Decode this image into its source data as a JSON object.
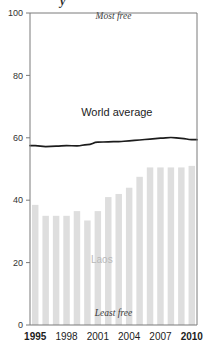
{
  "chart_data": {
    "type": "bar",
    "title": "",
    "xlabel": "",
    "ylabel": "",
    "ylim": [
      0,
      100
    ],
    "yticks": [
      0,
      20,
      40,
      60,
      80,
      100
    ],
    "xticks": [
      "1995",
      "1998",
      "2001",
      "2004",
      "2007",
      "2010"
    ],
    "xtick_bold": [
      "1995",
      "2010"
    ],
    "grid": false,
    "legend": "none",
    "categories": [
      "1995",
      "1996",
      "1997",
      "1998",
      "1999",
      "2000",
      "2001",
      "2002",
      "2003",
      "2004",
      "2005",
      "2006",
      "2007",
      "2008",
      "2009",
      "2010"
    ],
    "series": [
      {
        "name": "Laos",
        "kind": "bar",
        "color": "#dedede",
        "values": [
          38.5,
          35.0,
          35.0,
          35.0,
          36.5,
          33.5,
          36.5,
          41.0,
          42.0,
          44.0,
          47.5,
          50.5,
          50.5,
          50.5,
          50.5,
          51.0
        ]
      },
      {
        "name": "World average",
        "kind": "line",
        "color": "#1c1c1c",
        "values": [
          57.5,
          57.2,
          57.3,
          57.5,
          57.4,
          57.8,
          58.6,
          58.7,
          58.8,
          59.0,
          59.3,
          59.6,
          59.9,
          60.1,
          59.8,
          59.4
        ]
      }
    ],
    "annotations": [
      {
        "id": "most-free",
        "text": "Most free",
        "style": "italic",
        "x_pct": 50,
        "value": 98
      },
      {
        "id": "least-free",
        "text": "Least free",
        "style": "italic",
        "x_pct": 50,
        "value": 3
      },
      {
        "id": "laos-label",
        "text": "Laos",
        "style": "bar-series",
        "x_pct": 43,
        "value": 20
      },
      {
        "id": "world-average",
        "text": "World average",
        "style": "line-series",
        "x_pct": 52,
        "value": 67
      }
    ]
  },
  "title_fragment": "y"
}
